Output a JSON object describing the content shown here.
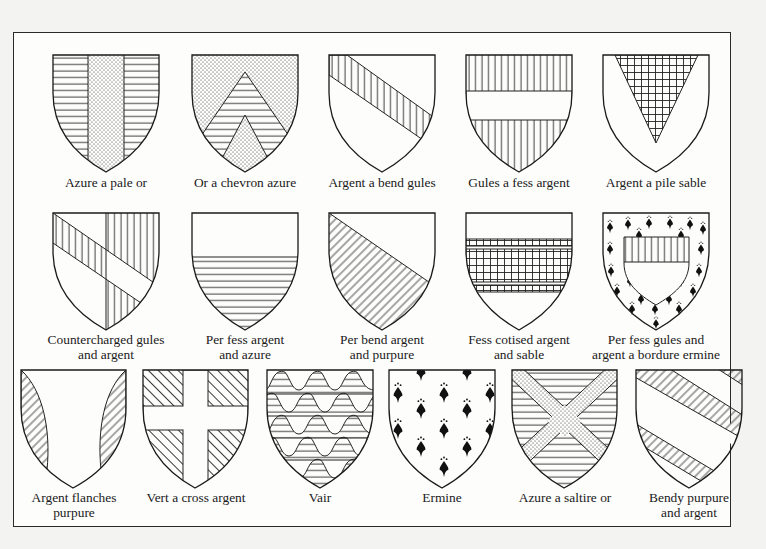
{
  "colors": {
    "background": "#f3f3f1",
    "paper": "#fdfdfc",
    "ink": "#1a1a1a"
  },
  "shields": [
    {
      "id": "azure-a-pale-or",
      "label": [
        "Azure a pale or"
      ],
      "x": 53,
      "y": 55,
      "w": 106,
      "h": 117,
      "lx": 106,
      "ly": 175
    },
    {
      "id": "or-a-chevron-azure",
      "label": [
        "Or a chevron azure"
      ],
      "x": 192,
      "y": 55,
      "w": 106,
      "h": 117,
      "lx": 245,
      "ly": 175
    },
    {
      "id": "argent-a-bend-gules",
      "label": [
        "Argent a bend gules"
      ],
      "x": 329,
      "y": 55,
      "w": 106,
      "h": 117,
      "lx": 382,
      "ly": 175
    },
    {
      "id": "gules-a-fess-argent",
      "label": [
        "Gules a fess argent"
      ],
      "x": 466,
      "y": 55,
      "w": 106,
      "h": 117,
      "lx": 519,
      "ly": 175
    },
    {
      "id": "argent-a-pile-sable",
      "label": [
        "Argent a pile sable"
      ],
      "x": 603,
      "y": 55,
      "w": 106,
      "h": 117,
      "lx": 656,
      "ly": 175
    },
    {
      "id": "countercharged-gules-and-argent",
      "label": [
        "Countercharged gules",
        "and argent"
      ],
      "x": 53,
      "y": 213,
      "w": 106,
      "h": 117,
      "lx": 106,
      "ly": 332
    },
    {
      "id": "per-fess-argent-and-azure",
      "label": [
        "Per fess argent",
        "and azure"
      ],
      "x": 192,
      "y": 213,
      "w": 106,
      "h": 117,
      "lx": 245,
      "ly": 332
    },
    {
      "id": "per-bend-argent-and-purpure",
      "label": [
        "Per bend argent",
        "and purpure"
      ],
      "x": 329,
      "y": 213,
      "w": 106,
      "h": 117,
      "lx": 382,
      "ly": 332
    },
    {
      "id": "fess-cotised-argent-and-sable",
      "label": [
        "Fess cotised argent",
        "and sable"
      ],
      "x": 466,
      "y": 213,
      "w": 106,
      "h": 117,
      "lx": 519,
      "ly": 332
    },
    {
      "id": "per-fess-gules-and-argent-a-bordure-ermine",
      "label": [
        "Per fess gules and",
        "argent a bordure ermine"
      ],
      "x": 603,
      "y": 213,
      "w": 106,
      "h": 117,
      "lx": 656,
      "ly": 332
    },
    {
      "id": "argent-flanches-purpure",
      "label": [
        "Argent flanches",
        "purpure"
      ],
      "x": 21,
      "y": 370,
      "w": 105,
      "h": 118,
      "lx": 74,
      "ly": 490
    },
    {
      "id": "vert-a-cross-argent",
      "label": [
        "Vert a cross argent"
      ],
      "x": 143,
      "y": 370,
      "w": 105,
      "h": 118,
      "lx": 196,
      "ly": 490
    },
    {
      "id": "vair",
      "label": [
        "Vair"
      ],
      "x": 267,
      "y": 370,
      "w": 106,
      "h": 118,
      "lx": 320,
      "ly": 490
    },
    {
      "id": "ermine",
      "label": [
        "Ermine"
      ],
      "x": 389,
      "y": 370,
      "w": 106,
      "h": 118,
      "lx": 442,
      "ly": 490
    },
    {
      "id": "azure-a-saltire-or",
      "label": [
        "Azure a saltire or"
      ],
      "x": 512,
      "y": 370,
      "w": 105,
      "h": 118,
      "lx": 565,
      "ly": 490
    },
    {
      "id": "bendy-purpure-and-argent",
      "label": [
        "Bendy purpure",
        "and argent"
      ],
      "x": 636,
      "y": 370,
      "w": 106,
      "h": 118,
      "lx": 689,
      "ly": 490
    }
  ]
}
